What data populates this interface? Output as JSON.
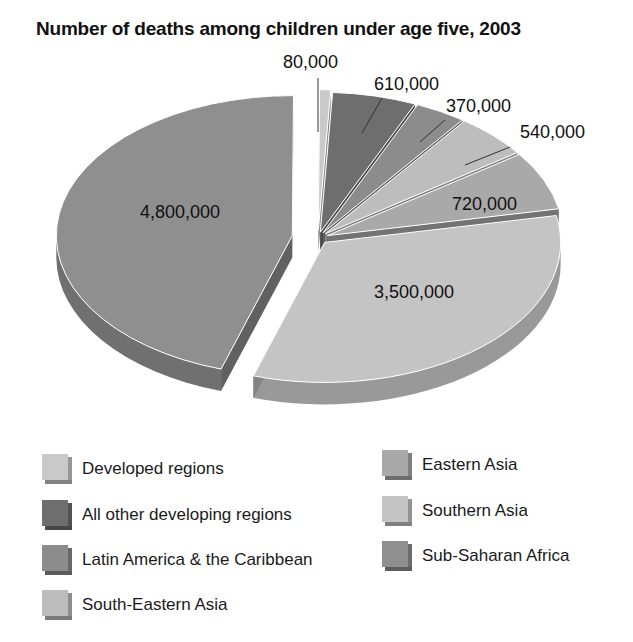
{
  "chart_data": {
    "type": "pie",
    "title": "Number of deaths among children under age five, 2003",
    "xlabel": "",
    "ylabel": "",
    "style": "3d-exploded",
    "legend_position": "bottom",
    "categories": [
      "Developed regions",
      "All other developing regions",
      "Latin America & the Caribbean",
      "South-Eastern Asia",
      "Eastern Asia",
      "Southern Asia",
      "Sub-Saharan Africa"
    ],
    "values": [
      80000,
      610000,
      370000,
      540000,
      720000,
      3500000,
      4800000
    ],
    "value_labels": [
      "80,000",
      "610,000",
      "370,000",
      "540,000",
      "720,000",
      "3,500,000",
      "4,800,000"
    ],
    "colors": [
      "#c9c9c9",
      "#6e6e6e",
      "#8c8c8c",
      "#bdbdbd",
      "#a9a9a9",
      "#c4c4c4",
      "#8f8f8f"
    ]
  },
  "legend": {
    "left": [
      {
        "label": "Developed regions",
        "color": "#c9c9c9"
      },
      {
        "label": "All other developing regions",
        "color": "#6e6e6e"
      },
      {
        "label": "Latin America & the Caribbean",
        "color": "#8c8c8c"
      },
      {
        "label": "South-Eastern Asia",
        "color": "#bdbdbd"
      }
    ],
    "right": [
      {
        "label": "Eastern Asia",
        "color": "#a9a9a9"
      },
      {
        "label": "Southern Asia",
        "color": "#c4c4c4"
      },
      {
        "label": "Sub-Saharan Africa",
        "color": "#8f8f8f"
      }
    ]
  }
}
